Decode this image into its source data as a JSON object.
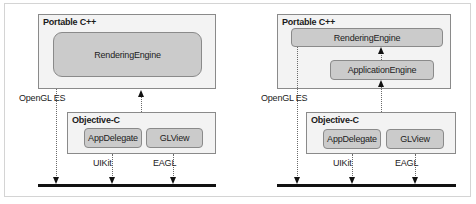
{
  "diagram": {
    "left": {
      "portable_title": "Portable C++",
      "rendering_engine": "RenderingEngine",
      "objc_title": "Objective-C",
      "app_delegate": "AppDelegate",
      "gl_view": "GLView",
      "opengl_label": "OpenGL ES",
      "uikit_label": "UIKit",
      "eagl_label": "EAGL"
    },
    "right": {
      "portable_title": "Portable C++",
      "rendering_engine": "RenderingEngine",
      "application_engine": "ApplicationEngine",
      "objc_title": "Objective-C",
      "app_delegate": "AppDelegate",
      "gl_view": "GLView",
      "opengl_label": "OpenGL ES",
      "uikit_label": "UIKit",
      "eagl_label": "EAGL"
    }
  },
  "colors": {
    "group_bg": "#f3f3f3",
    "component_bg": "#cbcbcb",
    "border": "#8a8a8a",
    "bar": "#111111"
  }
}
